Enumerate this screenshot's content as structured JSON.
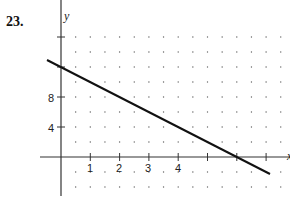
{
  "problem": {
    "number": "23."
  },
  "chart_data": {
    "type": "line",
    "title": "",
    "xlabel": "x",
    "ylabel": "y",
    "x_ticks": [
      1,
      2,
      3,
      4,
      5,
      6,
      7
    ],
    "x_tick_labels": [
      "1",
      "2",
      "3",
      "4"
    ],
    "y_ticks": [
      4,
      8,
      12,
      16
    ],
    "y_tick_labels": [
      "4",
      "8"
    ],
    "xlim": [
      -0.5,
      7.8
    ],
    "ylim": [
      -5,
      20
    ],
    "grid": "dots at 0.5 x-units and 2 y-units",
    "series": [
      {
        "name": "line",
        "equation": "y = 12 - 2x",
        "x": [
          -0.45,
          0,
          6,
          7
        ],
        "y": [
          12.9,
          12,
          0,
          -2
        ]
      }
    ],
    "intercepts": {
      "y_intercept": 12,
      "x_intercept": 6
    }
  },
  "labels": {
    "x1": "1",
    "x2": "2",
    "x3": "3",
    "x4": "4",
    "y4": "4",
    "y8": "8",
    "xaxis": "x",
    "yaxis": "y"
  },
  "colors": {
    "line": "#111111",
    "axis": "#333333",
    "grid_dot": "#666666"
  }
}
